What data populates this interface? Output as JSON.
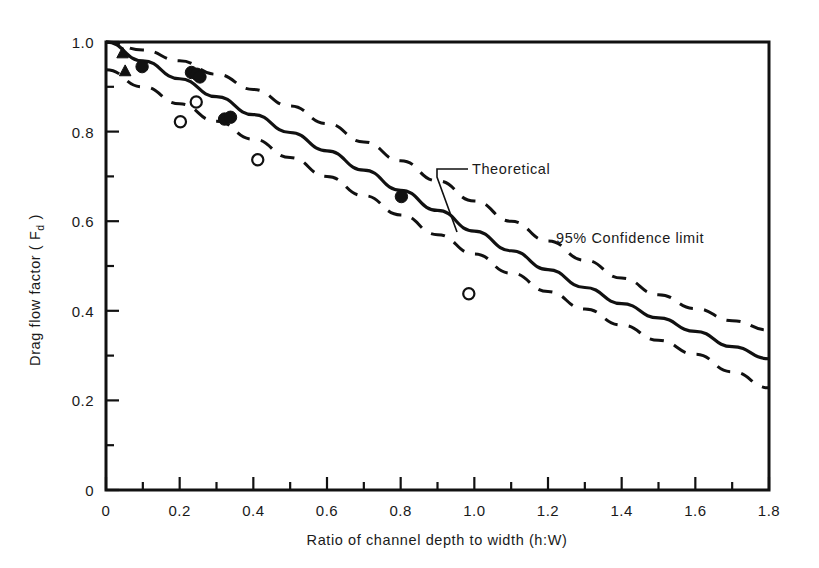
{
  "chart_data": {
    "type": "line",
    "title": "",
    "xlabel": "Ratio of channel depth to width (h:W)",
    "ylabel": "Drag flow factor ( F",
    "ylabel_sub": "d",
    "ylabel_tail": " )",
    "xlim": [
      0,
      1.8
    ],
    "ylim": [
      0,
      1.0
    ],
    "grid": false,
    "legend": "none",
    "xticks_major": [
      0,
      0.2,
      0.4,
      0.6,
      0.8,
      1.0,
      1.2,
      1.4,
      1.6,
      1.8
    ],
    "xticklabels": [
      "0",
      "0.2",
      "0.4",
      "0.6",
      "0.8",
      "1.0",
      "1.2",
      "1.4",
      "1.6",
      "1.8"
    ],
    "xticks_minor": [
      0.1,
      0.3,
      0.5,
      0.7,
      0.9,
      1.1,
      1.3,
      1.5,
      1.7
    ],
    "yticks_major": [
      0,
      0.2,
      0.4,
      0.6,
      0.8,
      1.0
    ],
    "yticklabels": [
      "0",
      "0.2",
      "0.4",
      "0.6",
      "0.8",
      "1.0"
    ],
    "yticks_minor": [
      0.1,
      0.3,
      0.5,
      0.7,
      0.9
    ],
    "series": [
      {
        "name": "Theoretical",
        "style": "solid",
        "x": [
          0.0,
          0.1,
          0.2,
          0.3,
          0.4,
          0.5,
          0.6,
          0.7,
          0.8,
          0.9,
          1.0,
          1.1,
          1.2,
          1.3,
          1.4,
          1.5,
          1.6,
          1.7,
          1.8
        ],
        "y": [
          1.0,
          0.958,
          0.918,
          0.878,
          0.838,
          0.798,
          0.757,
          0.714,
          0.669,
          0.624,
          0.578,
          0.534,
          0.492,
          0.452,
          0.416,
          0.384,
          0.354,
          0.32,
          0.293
        ]
      },
      {
        "name": "95% Confidence limit upper",
        "style": "dashed",
        "x": [
          0.0,
          0.1,
          0.2,
          0.3,
          0.4,
          0.5,
          0.6,
          0.7,
          0.8,
          0.9,
          1.0,
          1.1,
          1.2,
          1.3,
          1.4,
          1.5,
          1.6,
          1.7,
          1.8
        ],
        "y": [
          1.0,
          0.982,
          0.958,
          0.928,
          0.894,
          0.857,
          0.818,
          0.777,
          0.735,
          0.69,
          0.645,
          0.6,
          0.556,
          0.513,
          0.473,
          0.436,
          0.405,
          0.378,
          0.357
        ]
      },
      {
        "name": "95% Confidence limit lower",
        "style": "dashed",
        "x": [
          0.0,
          0.1,
          0.2,
          0.3,
          0.4,
          0.5,
          0.6,
          0.7,
          0.8,
          0.9,
          1.0,
          1.1,
          1.2,
          1.3,
          1.4,
          1.5,
          1.6,
          1.7,
          1.8
        ],
        "y": [
          0.938,
          0.9,
          0.862,
          0.823,
          0.783,
          0.742,
          0.7,
          0.657,
          0.614,
          0.57,
          0.527,
          0.484,
          0.443,
          0.404,
          0.368,
          0.334,
          0.303,
          0.264,
          0.228
        ]
      }
    ],
    "points": [
      {
        "marker": "filled-triangle",
        "x": 0.045,
        "y": 0.975
      },
      {
        "marker": "filled-triangle",
        "x": 0.052,
        "y": 0.935
      },
      {
        "marker": "filled-circle",
        "x": 0.098,
        "y": 0.945
      },
      {
        "marker": "filled-circle",
        "x": 0.232,
        "y": 0.932
      },
      {
        "marker": "filled-circle",
        "x": 0.247,
        "y": 0.928
      },
      {
        "marker": "filled-circle",
        "x": 0.255,
        "y": 0.922
      },
      {
        "marker": "open-circle",
        "x": 0.202,
        "y": 0.822
      },
      {
        "marker": "open-circle",
        "x": 0.245,
        "y": 0.866
      },
      {
        "marker": "filled-circle",
        "x": 0.322,
        "y": 0.828
      },
      {
        "marker": "filled-circle",
        "x": 0.338,
        "y": 0.832
      },
      {
        "marker": "open-circle",
        "x": 0.412,
        "y": 0.737
      },
      {
        "marker": "filled-circle",
        "x": 0.802,
        "y": 0.655
      },
      {
        "marker": "open-circle",
        "x": 0.985,
        "y": 0.438
      }
    ],
    "annotations": [
      {
        "id": "theoretical",
        "text": "Theoretical",
        "text_x": 0.98,
        "text_y": 0.718
      },
      {
        "id": "confidence",
        "text": "95% Confidence limit",
        "text_x": 1.22,
        "text_y": 0.565
      }
    ]
  },
  "colors": {
    "ink": "#111111",
    "background": "#ffffff"
  }
}
